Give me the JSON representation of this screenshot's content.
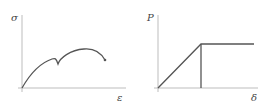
{
  "panels": [
    {
      "id": "stress-strain",
      "y_label": "σ",
      "x_label": "ε",
      "description": "Stress–strain curve with initial rise, local peak, sudden drop, then a higher maximum and descending end with a terminal dot"
    },
    {
      "id": "load-displacement",
      "y_label": "P",
      "x_label": "δ",
      "description": "Elastic–perfectly plastic load–displacement: linear rise to a yield point, then horizontal plateau; vertical line marks yield displacement"
    }
  ],
  "colors": {
    "axis": "#bdbdbd",
    "curve": "#555555",
    "label": "#444444"
  }
}
